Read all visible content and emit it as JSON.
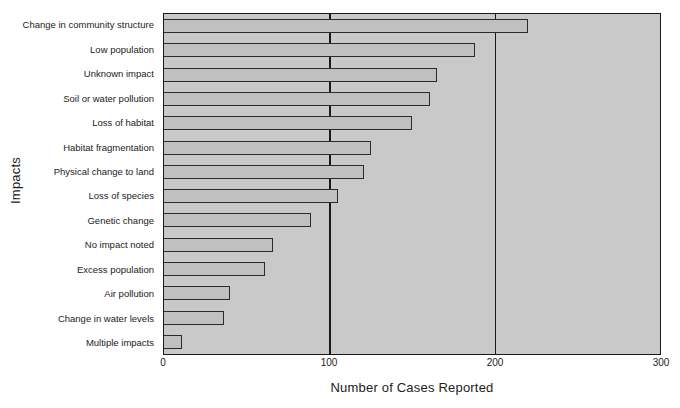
{
  "chart_data": {
    "type": "bar",
    "orientation": "horizontal",
    "title": "",
    "xlabel": "Number of Cases Reported",
    "ylabel": "Impacts",
    "categories": [
      "Change in community structure",
      "Low population",
      "Unknown impact",
      "Soil or water pollution",
      "Loss of habitat",
      "Habitat fragmentation",
      "Physical change to land",
      "Loss of species",
      "Genetic change",
      "No impact noted",
      "Excess population",
      "Air pollution",
      "Change in water levels",
      "Multiple impacts"
    ],
    "values": [
      220,
      188,
      165,
      161,
      150,
      125,
      121,
      105,
      89,
      66,
      61,
      40,
      36,
      11
    ],
    "xlim": [
      0,
      300
    ],
    "xticks": [
      0,
      100,
      200,
      300
    ],
    "xtick_labels": [
      "0",
      "100",
      "200",
      "300"
    ],
    "gridlines_x": [
      100,
      200
    ],
    "grid": true,
    "legend": null,
    "colors": {
      "plot_background": "#c9c9c9",
      "bar_fill": "#c0c0c0",
      "bar_outline": "#2b2b2b",
      "axis": "#1a1a1a",
      "text": "#1b1b1b"
    }
  }
}
